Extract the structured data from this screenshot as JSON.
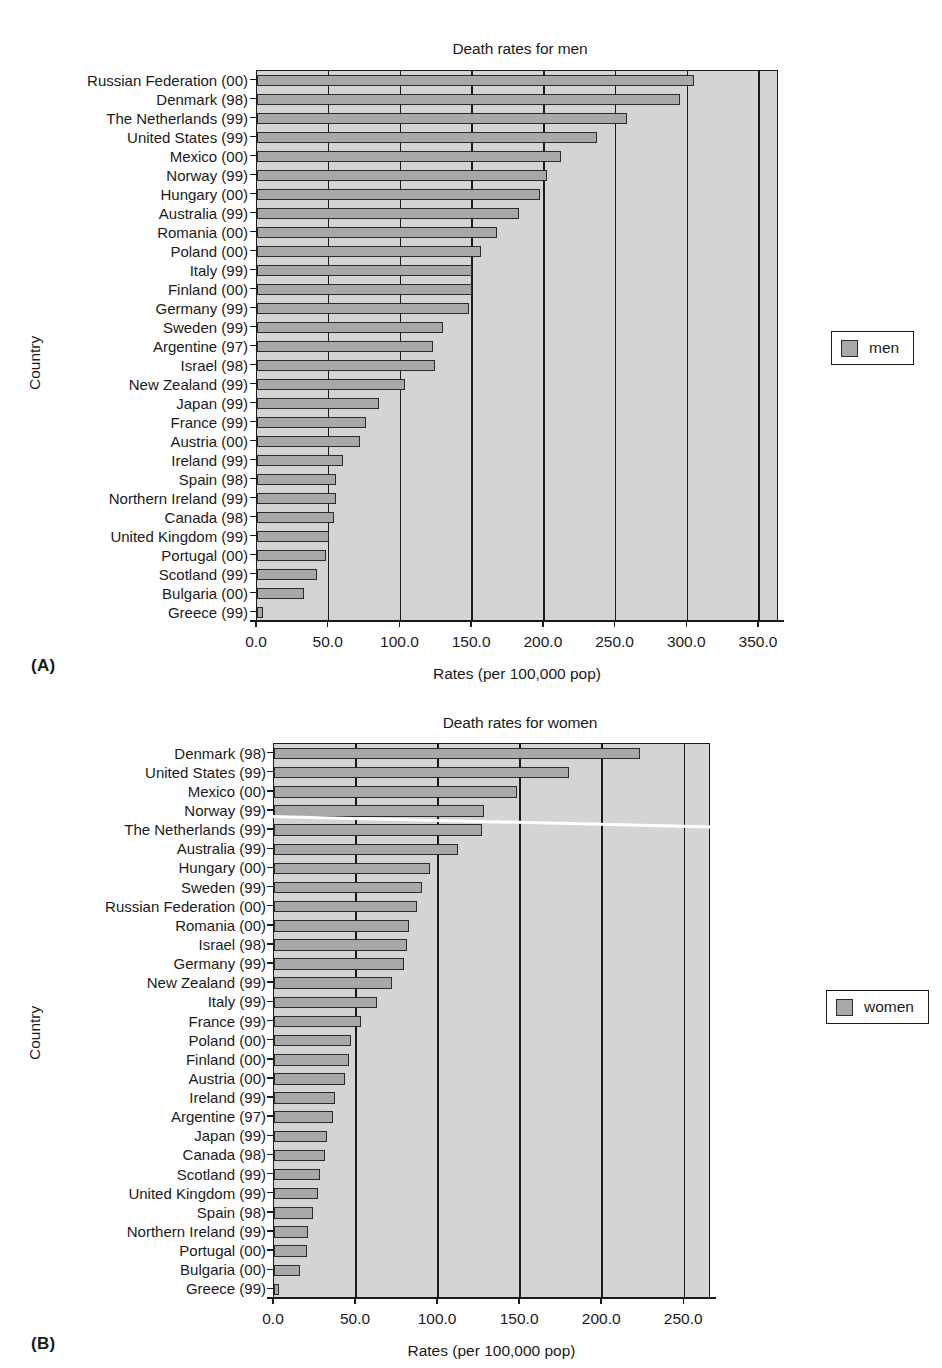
{
  "panels": [
    {
      "letter": "(A)",
      "title": "Death rates for men",
      "xlabel": "Rates (per 100,000 pop)",
      "ylabel": "Country",
      "legend_label": "men",
      "xticks": [
        "0.0",
        "50.0",
        "100.0",
        "150.0",
        "200.0",
        "250.0",
        "300.0",
        "350.0"
      ]
    },
    {
      "letter": "(B)",
      "title": "Death rates for women",
      "xlabel": "Rates (per 100,000 pop)",
      "ylabel": "Country",
      "legend_label": "women",
      "xticks": [
        "0.0",
        "50.0",
        "100.0",
        "150.0",
        "200.0",
        "250.0"
      ]
    }
  ],
  "chart_data": [
    {
      "type": "bar",
      "orientation": "horizontal",
      "title": "Death rates for men",
      "xlabel": "Rates (per 100,000 pop)",
      "ylabel": "Country",
      "xlim": [
        0,
        350
      ],
      "xticks": [
        0,
        50,
        100,
        150,
        200,
        250,
        300,
        350
      ],
      "grid": true,
      "legend": {
        "entries": [
          "men"
        ],
        "position": "right"
      },
      "series_name": "men",
      "color": "#a8a8a8",
      "categories": [
        "Russian Federation (00)",
        "Denmark (98)",
        "The Netherlands (99)",
        "United States (99)",
        "Mexico (00)",
        "Norway (99)",
        "Hungary (00)",
        "Australia (99)",
        "Romania (00)",
        "Poland (00)",
        "Italy (99)",
        "Finland (00)",
        "Germany (99)",
        "Sweden (99)",
        "Argentine (97)",
        "Israel (98)",
        "New Zealand (99)",
        "Japan (99)",
        "France (99)",
        "Austria (00)",
        "Ireland (99)",
        "Spain (98)",
        "Northern Ireland (99)",
        "Canada (98)",
        "United Kingdom (99)",
        "Portugal (00)",
        "Scotland (99)",
        "Bulgaria (00)",
        "Greece (99)"
      ],
      "values": [
        305,
        295,
        258,
        237,
        212,
        202,
        197,
        183,
        167,
        156,
        150,
        150,
        148,
        130,
        123,
        124,
        103,
        85,
        76,
        72,
        60,
        55,
        55,
        54,
        50,
        48,
        42,
        33,
        4
      ]
    },
    {
      "type": "bar",
      "orientation": "horizontal",
      "title": "Death rates for women",
      "xlabel": "Rates (per 100,000 pop)",
      "ylabel": "Country",
      "xlim": [
        0,
        250
      ],
      "xticks": [
        0,
        50,
        100,
        150,
        200,
        250
      ],
      "grid": true,
      "legend": {
        "entries": [
          "women"
        ],
        "position": "right"
      },
      "series_name": "women",
      "color": "#a8a8a8",
      "categories": [
        "Denmark (98)",
        "United States (99)",
        "Mexico (00)",
        "Norway (99)",
        "The Netherlands (99)",
        "Australia (99)",
        "Hungary (00)",
        "Sweden (99)",
        "Russian Federation (00)",
        "Romania (00)",
        "Israel (98)",
        "Germany (99)",
        "New Zealand (99)",
        "Italy (99)",
        "France (99)",
        "Poland (00)",
        "Finland (00)",
        "Austria (00)",
        "Ireland (99)",
        "Argentine (97)",
        "Japan (99)",
        "Canada (98)",
        "Scotland (99)",
        "United Kingdom (99)",
        "Spain (98)",
        "Northern Ireland (99)",
        "Portugal (00)",
        "Bulgaria (00)",
        "Greece (99)"
      ],
      "values": [
        223,
        180,
        148,
        128,
        127,
        112,
        95,
        90,
        87,
        82,
        81,
        79,
        72,
        63,
        53,
        47,
        46,
        43,
        37,
        36,
        32,
        31,
        28,
        27,
        24,
        21,
        20,
        16,
        2
      ]
    }
  ]
}
